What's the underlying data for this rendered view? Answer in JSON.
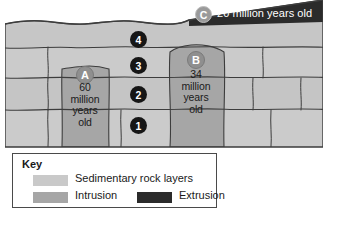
{
  "diagram": {
    "colors": {
      "sedimentary": "#c9c9c9",
      "sedimentary_alt": "#c2c2c2",
      "intrusion": "#a6a6a6",
      "extrusion": "#2b2b2b",
      "outline": "#3d3d3d",
      "sky": "#ffffff",
      "badge_number_fill": "#161616",
      "badge_letter_fill": "#8f8f8f",
      "badge_c_fill": "#9a9a9a",
      "badge_text": "#ffffff",
      "label_text": "#1a1a1a"
    },
    "layers": [
      {
        "id": "1",
        "label": "1",
        "type": "sedimentary"
      },
      {
        "id": "2",
        "label": "2",
        "type": "sedimentary"
      },
      {
        "id": "3",
        "label": "3",
        "type": "sedimentary"
      },
      {
        "id": "4",
        "label": "4",
        "type": "sedimentary"
      }
    ],
    "features": [
      {
        "id": "A",
        "label": "A",
        "type": "intrusion",
        "age_text": "60\nmillion\nyears\nold",
        "age_value": 60,
        "age_unit": "million years old"
      },
      {
        "id": "B",
        "label": "B",
        "type": "intrusion",
        "age_text": "34\nmillion\nyears\nold",
        "age_value": 34,
        "age_unit": "million years old"
      },
      {
        "id": "C",
        "label": "C",
        "type": "extrusion",
        "age_text": "20 million years old",
        "age_value": 20,
        "age_unit": "million years old"
      }
    ]
  },
  "key": {
    "title": "Key",
    "entries": [
      {
        "label": "Sedimentary rock layers",
        "swatch": "#c9c9c9",
        "icon": "sedimentary-swatch"
      },
      {
        "label": "Intrusion",
        "swatch": "#a6a6a6",
        "icon": "intrusion-swatch"
      },
      {
        "label": "Extrusion",
        "swatch": "#2b2b2b",
        "icon": "extrusion-swatch"
      }
    ]
  }
}
